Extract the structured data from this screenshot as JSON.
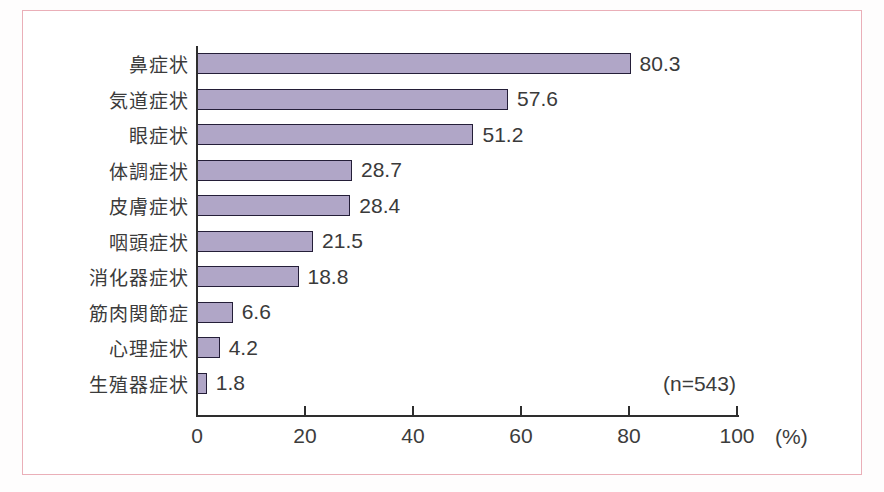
{
  "figure": {
    "frame_border_color": "#eaafb8",
    "background_color": "#ffffff"
  },
  "chart_data": {
    "type": "bar",
    "orientation": "horizontal",
    "title": "",
    "xlabel": "",
    "ylabel": "",
    "x_axis_unit": "(%)",
    "annotation": "(n=543)",
    "xlim": [
      0,
      100
    ],
    "x_ticks": [
      0,
      20,
      40,
      60,
      80,
      100
    ],
    "grid": false,
    "legend": false,
    "categories": [
      "鼻症状",
      "気道症状",
      "眼症状",
      "体調症状",
      "皮膚症状",
      "咽頭症状",
      "消化器症状",
      "筋肉関節症",
      "心理症状",
      "生殖器症状"
    ],
    "values": [
      80.3,
      57.6,
      51.2,
      28.7,
      28.4,
      21.5,
      18.8,
      6.6,
      4.2,
      1.8
    ],
    "value_labels": [
      "80.3",
      "57.6",
      "51.2",
      "28.7",
      "28.4",
      "21.5",
      "18.8",
      "6.6",
      "4.2",
      "1.8"
    ],
    "bar_fill_color": "#b0a6c7",
    "bar_border_color": "#241e38",
    "axis_color": "#2e2e2e",
    "text_color": "#3c3c3c"
  }
}
